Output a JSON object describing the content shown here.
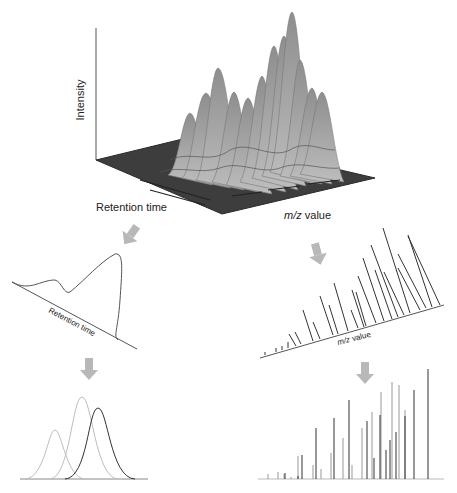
{
  "surface_3d": {
    "y_axis_label": "Intensity",
    "x_axis_label": "Retention time",
    "z_axis_label_italic": "m/z",
    "z_axis_label_rest": " value"
  },
  "chromatogram": {
    "axis_label": "Retention time"
  },
  "mass_spectrum": {
    "axis_label": "m/z value"
  },
  "colors": {
    "arrow": "#b8b8b8",
    "surface_base": "#3a3a3a",
    "peak_fill": "#a8a8a8",
    "line": "#333333",
    "light_line": "#bdbdbd"
  },
  "deconvolved_peaks": [
    {
      "center": 57,
      "height": 80,
      "shade": "light"
    },
    {
      "center": 82,
      "height": 105,
      "shade": "light"
    },
    {
      "center": 98,
      "height": 95,
      "shade": "dark"
    }
  ]
}
